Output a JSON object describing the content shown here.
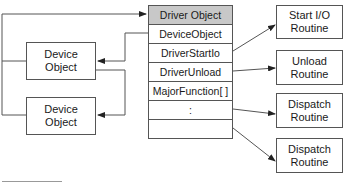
{
  "diagram": {
    "driver_object": {
      "title": "Driver Object",
      "fields": [
        "DeviceObject",
        "DriverStartIo",
        "DriverUnload",
        "MajorFunction[ ]",
        ":",
        ""
      ]
    },
    "device_objects": [
      {
        "label": "Device\nObject"
      },
      {
        "label": "Device\nObject"
      }
    ],
    "routines": [
      {
        "label": "Start I/O\nRoutine"
      },
      {
        "label": "Unload\nRoutine"
      },
      {
        "label": "Dispatch\nRoutine"
      },
      {
        "label": "Dispatch\nRoutine"
      }
    ],
    "colors": {
      "header_fill": "#c8c8c8",
      "line": "#555555"
    }
  }
}
